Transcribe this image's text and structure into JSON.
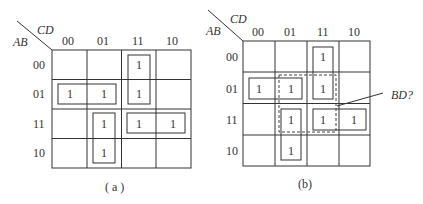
{
  "maps": [
    {
      "id": "a",
      "caption": "( a )",
      "row_var": "AB",
      "col_var": "CD",
      "col_labels": [
        "00",
        "01",
        "11",
        "10"
      ],
      "row_labels": [
        "00",
        "01",
        "11",
        "10"
      ],
      "cells": [
        [
          "",
          "",
          "1",
          ""
        ],
        [
          "1",
          "1",
          "1",
          ""
        ],
        [
          "",
          "1",
          "1",
          "1"
        ],
        [
          "",
          "1",
          "",
          ""
        ]
      ],
      "groups": [
        {
          "cells": [
            [
              0,
              2
            ],
            [
              1,
              2
            ]
          ],
          "style": "solid"
        },
        {
          "cells": [
            [
              1,
              0
            ],
            [
              1,
              1
            ]
          ],
          "style": "solid"
        },
        {
          "cells": [
            [
              2,
              1
            ],
            [
              3,
              1
            ]
          ],
          "style": "solid"
        },
        {
          "cells": [
            [
              2,
              2
            ],
            [
              2,
              3
            ]
          ],
          "style": "solid"
        }
      ]
    },
    {
      "id": "b",
      "caption": "(b)",
      "row_var": "AB",
      "col_var": "CD",
      "col_labels": [
        "00",
        "01",
        "11",
        "10"
      ],
      "row_labels": [
        "00",
        "01",
        "11",
        "10"
      ],
      "cells": [
        [
          "",
          "",
          "1",
          ""
        ],
        [
          "1",
          "1",
          "1",
          ""
        ],
        [
          "",
          "1",
          "1",
          "1"
        ],
        [
          "",
          "1",
          "",
          ""
        ]
      ],
      "groups": [
        {
          "cells": [
            [
              0,
              2
            ],
            [
              1,
              2
            ]
          ],
          "style": "solid"
        },
        {
          "cells": [
            [
              1,
              0
            ],
            [
              1,
              1
            ]
          ],
          "style": "solid"
        },
        {
          "cells": [
            [
              2,
              1
            ],
            [
              3,
              1
            ]
          ],
          "style": "solid"
        },
        {
          "cells": [
            [
              2,
              2
            ],
            [
              2,
              3
            ]
          ],
          "style": "solid"
        },
        {
          "cells": [
            [
              1,
              1
            ],
            [
              1,
              2
            ],
            [
              2,
              1
            ],
            [
              2,
              2
            ]
          ],
          "style": "dashed",
          "label": "BD?"
        }
      ],
      "annotation": "BD?"
    }
  ]
}
